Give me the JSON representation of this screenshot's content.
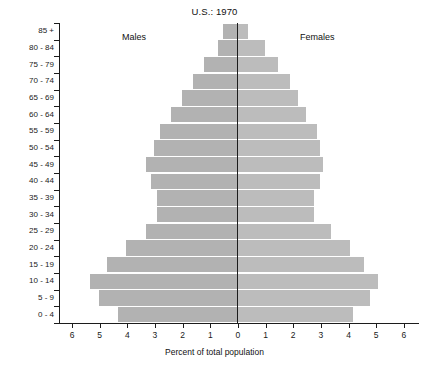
{
  "chart_data": {
    "type": "bar",
    "subtype": "population-pyramid",
    "title": "U.S.: 1970",
    "xlabel": "Percent of total population",
    "ylabel": "",
    "categories": [
      "0 - 4",
      "5 - 9",
      "10 - 14",
      "15 - 19",
      "20 - 24",
      "25 - 29",
      "30 - 34",
      "35 - 39",
      "40 - 44",
      "45 - 49",
      "50 - 54",
      "55 - 59",
      "60 - 64",
      "65 - 69",
      "70 - 74",
      "75 - 79",
      "80 - 84",
      "85 +"
    ],
    "series": [
      {
        "name": "Males",
        "side": "left",
        "values": [
          4.3,
          5.0,
          5.3,
          4.7,
          4.0,
          3.3,
          2.9,
          2.9,
          3.1,
          3.3,
          3.0,
          2.8,
          2.4,
          2.0,
          1.6,
          1.2,
          0.7,
          0.5
        ]
      },
      {
        "name": "Females",
        "side": "right",
        "values": [
          4.2,
          4.8,
          5.1,
          4.6,
          4.1,
          3.4,
          2.8,
          2.8,
          3.0,
          3.1,
          3.0,
          2.9,
          2.5,
          2.2,
          1.9,
          1.5,
          1.0,
          0.4
        ]
      }
    ],
    "xlim": [
      -6.5,
      6.5
    ],
    "xticks": [
      6,
      5,
      4,
      3,
      2,
      1,
      0,
      1,
      2,
      3,
      4,
      5,
      6
    ],
    "xtick_values": [
      -6,
      -5,
      -4,
      -3,
      -2,
      -1,
      0,
      1,
      2,
      3,
      4,
      5,
      6
    ],
    "grid": false,
    "legend_position": "inline-top",
    "colors": {
      "male_bar": "#b2b2b2",
      "female_bar": "#bcbcbc",
      "axis": "#1c1c1c",
      "background": "#ffffff"
    },
    "annotations": [
      {
        "name": "males-caption",
        "text": "Males"
      },
      {
        "name": "females-caption",
        "text": "Females"
      }
    ]
  }
}
